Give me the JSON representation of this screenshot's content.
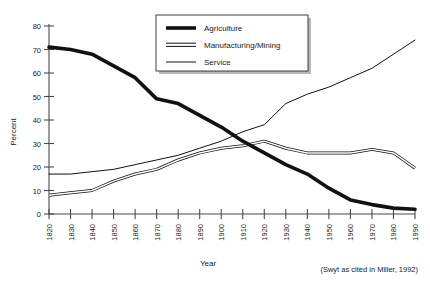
{
  "chart_data": {
    "type": "line",
    "title": "",
    "xlabel": "Year",
    "ylabel": "Percent",
    "xlim": [
      1820,
      1990
    ],
    "ylim": [
      0,
      80
    ],
    "grid": false,
    "legend_position": "top-center",
    "x": [
      1820,
      1830,
      1840,
      1850,
      1860,
      1870,
      1880,
      1890,
      1900,
      1910,
      1920,
      1930,
      1940,
      1950,
      1960,
      1970,
      1980,
      1990
    ],
    "xtick_labels": [
      "1820",
      "1830",
      "1840",
      "1850",
      "1860",
      "1870",
      "1880",
      "1890",
      "1900",
      "1910",
      "1920",
      "1930",
      "1940",
      "1950",
      "1960",
      "1970",
      "1980",
      "1990"
    ],
    "ytick_labels": [
      "0",
      "10",
      "20",
      "30",
      "40",
      "50",
      "60",
      "70",
      "80"
    ],
    "ytick_values": [
      0,
      10,
      20,
      30,
      40,
      50,
      60,
      70,
      80
    ],
    "series": [
      {
        "name": "Agriculture",
        "style": "thick-solid",
        "values": [
          71,
          70,
          68,
          63,
          58,
          49,
          47,
          42,
          37,
          31,
          26,
          21,
          17,
          11,
          6,
          4,
          2.5,
          2
        ]
      },
      {
        "name": "Manufacturing/Mining",
        "style": "double-line",
        "values": [
          8,
          9,
          10,
          14,
          17,
          19,
          23,
          26,
          28,
          29,
          31,
          28,
          26,
          26,
          26,
          27.5,
          26,
          19.5
        ]
      },
      {
        "name": "Service",
        "style": "thin-solid",
        "values": [
          17,
          17,
          18,
          19,
          21,
          23,
          25,
          28,
          31,
          35,
          38,
          47,
          51,
          54,
          58,
          62,
          68,
          74
        ]
      }
    ],
    "annotations": [
      {
        "name": "source-citation",
        "text": "(Swyt as cited in Miller, 1992)"
      }
    ]
  },
  "legend": {
    "items": [
      {
        "label": "Agriculture"
      },
      {
        "label": "Manufacturing/Mining"
      },
      {
        "label": "Service"
      }
    ]
  }
}
